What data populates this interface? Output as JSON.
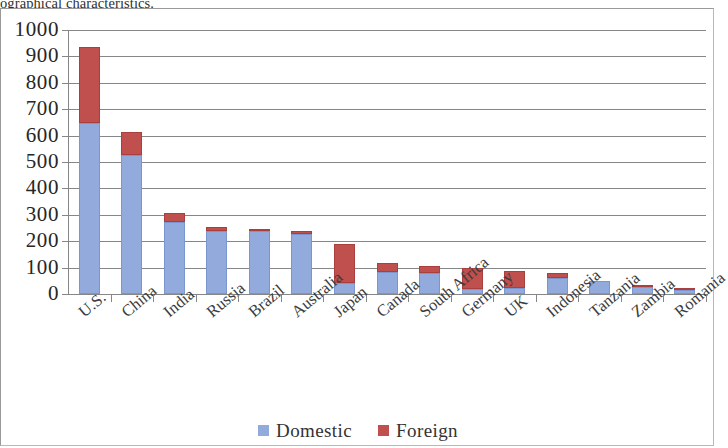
{
  "document": {
    "clipped_text_above_chart": "ographical characteristics."
  },
  "legend": {
    "position": "bottom-center",
    "items": [
      {
        "label": "Domestic",
        "color": "#92AADC",
        "swatch_name": "legend-swatch-domestic"
      },
      {
        "label": "Foreign",
        "color": "#C0504D",
        "swatch_name": "legend-swatch-foreign"
      }
    ]
  },
  "axis": {
    "y_ticks": [
      "1000",
      "900",
      "800",
      "700",
      "600",
      "500",
      "400",
      "300",
      "200",
      "100",
      "0"
    ]
  },
  "chart_data": {
    "type": "bar",
    "subtype": "stacked-column",
    "title": "",
    "subtitle": "",
    "xlabel": "",
    "ylabel": "",
    "ylim": [
      0,
      1000
    ],
    "ytick_interval": 100,
    "grid": true,
    "grid_axis": "y",
    "legend_position": "bottom-center",
    "categories": [
      "U.S.",
      "China",
      "India",
      "Russia",
      "Brazil",
      "Australia",
      "Japan",
      "Canada",
      "South Africa",
      "Germany",
      "UK",
      "Indonesia",
      "Tanzania",
      "Zambia",
      "Romania"
    ],
    "series": [
      {
        "name": "Domestic",
        "color": "#92AADC",
        "values": [
          648,
          528,
          272,
          237,
          239,
          228,
          40,
          85,
          80,
          20,
          22,
          60,
          48,
          28,
          14
        ]
      },
      {
        "name": "Foreign",
        "color": "#C0504D",
        "values": [
          287,
          87,
          36,
          16,
          9,
          9,
          148,
          32,
          28,
          77,
          66,
          20,
          0,
          4,
          4
        ]
      }
    ],
    "totals": [
      935,
      615,
      308,
      253,
      248,
      237,
      188,
      117,
      108,
      97,
      88,
      80,
      48,
      32,
      18
    ]
  }
}
